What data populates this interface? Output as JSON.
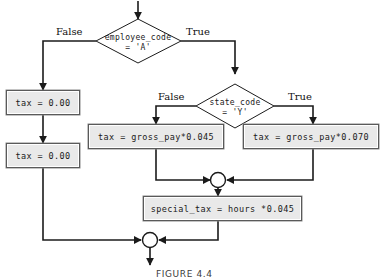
{
  "figure": {
    "caption": "FIGURE 4.4",
    "colors": {
      "line": "#1b1b1b",
      "box_fill": "#e9e9e9",
      "box_border": "#5a5a5a",
      "text": "#1a1a1a",
      "background": "#ffffff"
    }
  },
  "decisions": [
    {
      "id": "employee-code-decision",
      "line1": "employee_code",
      "line2": "= 'A'",
      "false_label": "False",
      "true_label": "True"
    },
    {
      "id": "state-code-decision",
      "line1": "state_code",
      "line2": "= 'Y'",
      "false_label": "False",
      "true_label": "True"
    }
  ],
  "processes": [
    {
      "id": "tax-zero-first",
      "text": "tax = 0.00"
    },
    {
      "id": "tax-zero-second",
      "text": "tax = 0.00"
    },
    {
      "id": "tax-gross-045",
      "text": "tax = gross_pay*0.045"
    },
    {
      "id": "tax-gross-070",
      "text": "tax = gross_pay*0.070"
    },
    {
      "id": "special-tax",
      "text": "special_tax = hours *0.045"
    }
  ],
  "connectors": [
    {
      "id": "merge-circle-upper"
    },
    {
      "id": "merge-circle-lower"
    }
  ]
}
